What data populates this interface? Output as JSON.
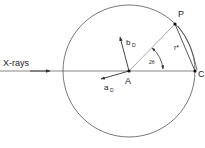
{
  "diagram": {
    "type": "geometry",
    "labels": {
      "beam": "X-rays",
      "point_A": "A",
      "point_P": "P",
      "point_C": "C",
      "vector_a": "a",
      "vector_a_sub": "D",
      "vector_b": "b",
      "vector_b_sub": "D",
      "radius_r": "r*",
      "angle": "2θ"
    },
    "colors": {
      "stroke": "#333333",
      "text": "#222222"
    }
  }
}
